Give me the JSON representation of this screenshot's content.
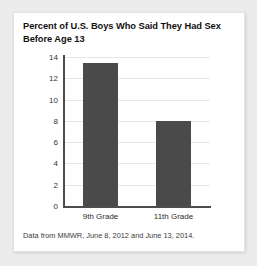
{
  "chart_data": {
    "type": "bar",
    "title": "Percent of U.S. Boys Who Said They Had Sex Before Age 13",
    "categories": [
      "9th Grade",
      "11th Grade"
    ],
    "values": [
      13.4,
      8.0
    ],
    "xlabel": "",
    "ylabel": "",
    "ylim": [
      0,
      14
    ],
    "yticks": [
      0,
      2,
      4,
      6,
      8,
      10,
      12,
      14
    ],
    "ytick_labels": [
      "0",
      "2",
      "4",
      "6",
      "8",
      "10",
      "12",
      "14"
    ],
    "grid": true,
    "legend": false,
    "bar_color": "#4a4a4a",
    "source_note": "Data from MMWR, June 8, 2012 and June 13, 2014."
  }
}
